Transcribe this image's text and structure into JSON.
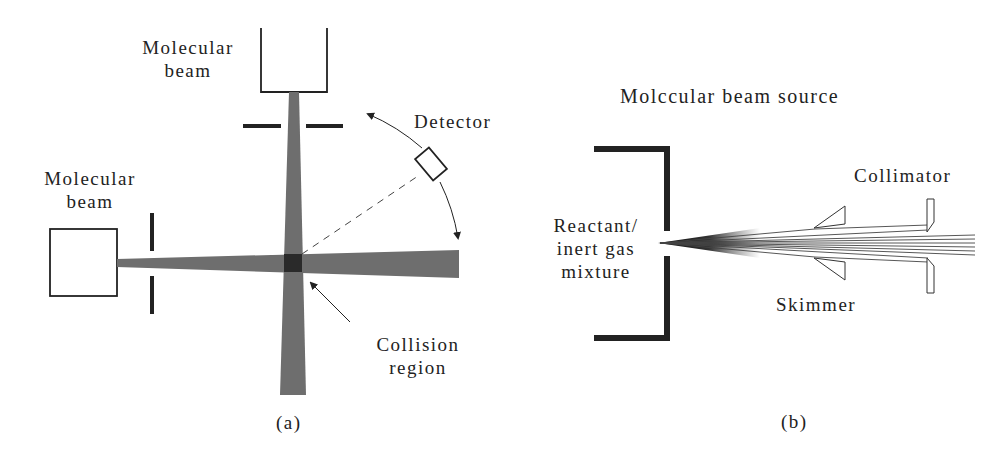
{
  "figure": {
    "panel_a": {
      "caption": "(a)",
      "labels": {
        "top_source": [
          "Molecular",
          "beam"
        ],
        "left_source": [
          "Molecular",
          "beam"
        ],
        "detector": "Detector",
        "collision": [
          "Collision",
          "region"
        ]
      }
    },
    "panel_b": {
      "caption": "(b)",
      "title": "Molccular beam source",
      "labels": {
        "reservoir": [
          "Reactant/",
          "inert gas",
          "mixture"
        ],
        "collimator": "Collimator",
        "skimmer": "Skimmer"
      }
    },
    "colors": {
      "beam": "#6e6e6e",
      "crossing": "#2a2a2a",
      "line": "#222222",
      "background": "#ffffff"
    }
  }
}
